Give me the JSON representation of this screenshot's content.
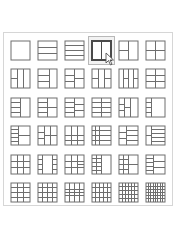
{
  "layout_picker": {
    "title": "Layout picker",
    "selected_index": 3,
    "colors": {
      "stroke": "#6e6e6e",
      "selected_stroke": "#4a4a4a",
      "selected_bg": "#f2f2f2",
      "selected_border": "#b8b8b8",
      "panel_border": "#d6d6d6"
    },
    "layouts": [
      {
        "name": "layout-1x1",
        "lines": []
      },
      {
        "name": "layout-3-rows",
        "lines": [
          [
            0,
            0.33,
            1,
            0.33
          ],
          [
            0,
            0.67,
            1,
            0.67
          ]
        ]
      },
      {
        "name": "layout-4-rows",
        "lines": [
          [
            0,
            0.25,
            1,
            0.25
          ],
          [
            0,
            0.5,
            1,
            0.5
          ],
          [
            0,
            0.75,
            1,
            0.75
          ]
        ]
      },
      {
        "name": "layout-2-cols",
        "lines": [
          [
            0.5,
            0,
            0.5,
            1
          ]
        ]
      },
      {
        "name": "layout-1-top-2-bottom",
        "lines": [
          [
            0.5,
            0,
            0.5,
            1
          ],
          [
            0,
            0.5,
            0.5,
            0.5
          ]
        ]
      },
      {
        "name": "layout-2x2",
        "lines": [
          [
            0.5,
            0,
            0.5,
            1
          ],
          [
            0,
            0.5,
            1,
            0.5
          ]
        ]
      },
      {
        "name": "layout-3-cols-split-left",
        "lines": [
          [
            0.33,
            0,
            0.33,
            1
          ],
          [
            0.67,
            0,
            0.67,
            1
          ],
          [
            0,
            0.5,
            0.33,
            0.5
          ]
        ]
      },
      {
        "name": "layout-left-3-rows-right-1",
        "lines": [
          [
            0.6,
            0,
            0.6,
            1
          ],
          [
            0,
            0.33,
            0.6,
            0.33
          ],
          [
            0,
            0.67,
            0.6,
            0.67
          ]
        ]
      },
      {
        "name": "layout-left-3-rows-right-2",
        "lines": [
          [
            0.5,
            0,
            0.5,
            1
          ],
          [
            0,
            0.33,
            0.5,
            0.33
          ],
          [
            0,
            0.67,
            0.5,
            0.67
          ],
          [
            0.5,
            0.5,
            1,
            0.5
          ]
        ]
      },
      {
        "name": "layout-3-cols-split-left-right",
        "lines": [
          [
            0.33,
            0,
            0.33,
            1
          ],
          [
            0.67,
            0,
            0.67,
            1
          ],
          [
            0,
            0.5,
            0.33,
            0.5
          ],
          [
            0.67,
            0.5,
            1,
            0.5
          ]
        ]
      },
      {
        "name": "layout-4-cols-split",
        "lines": [
          [
            0.25,
            0,
            0.25,
            1
          ],
          [
            0.5,
            0,
            0.5,
            1
          ],
          [
            0.75,
            0,
            0.75,
            1
          ],
          [
            0.25,
            0.5,
            0.5,
            0.5
          ],
          [
            0.75,
            0.5,
            1,
            0.5
          ]
        ]
      },
      {
        "name": "layout-2x3",
        "lines": [
          [
            0.5,
            0,
            0.5,
            1
          ],
          [
            0,
            0.33,
            1,
            0.33
          ],
          [
            0,
            0.67,
            1,
            0.67
          ]
        ]
      },
      {
        "name": "layout-left-4-rows-right-1",
        "lines": [
          [
            0.5,
            0,
            0.5,
            1
          ],
          [
            0,
            0.25,
            0.5,
            0.25
          ],
          [
            0,
            0.5,
            0.5,
            0.5
          ],
          [
            0,
            0.75,
            0.5,
            0.75
          ]
        ]
      },
      {
        "name": "layout-left-4-rows-right-2",
        "lines": [
          [
            0.5,
            0,
            0.5,
            1
          ],
          [
            0,
            0.25,
            0.5,
            0.25
          ],
          [
            0,
            0.5,
            0.5,
            0.5
          ],
          [
            0,
            0.75,
            0.5,
            0.75
          ],
          [
            0.5,
            0.5,
            1,
            0.5
          ]
        ]
      },
      {
        "name": "layout-left-4-rows-right-3",
        "lines": [
          [
            0.5,
            0,
            0.5,
            1
          ],
          [
            0,
            0.25,
            0.5,
            0.25
          ],
          [
            0,
            0.5,
            0.5,
            0.5
          ],
          [
            0,
            0.75,
            0.5,
            0.75
          ],
          [
            0.5,
            0.33,
            1,
            0.33
          ],
          [
            0.5,
            0.67,
            1,
            0.67
          ]
        ]
      },
      {
        "name": "layout-2x4",
        "lines": [
          [
            0.5,
            0,
            0.5,
            1
          ],
          [
            0,
            0.25,
            1,
            0.25
          ],
          [
            0,
            0.5,
            1,
            0.5
          ],
          [
            0,
            0.75,
            1,
            0.75
          ]
        ]
      },
      {
        "name": "layout-left-col-split-wide-right",
        "lines": [
          [
            0.3,
            0,
            0.3,
            1
          ],
          [
            0.6,
            0,
            0.6,
            1
          ],
          [
            0,
            0.33,
            0.3,
            0.33
          ],
          [
            0.3,
            0.5,
            0.6,
            0.5
          ],
          [
            0,
            0.67,
            0.3,
            0.67
          ]
        ]
      },
      {
        "name": "layout-narrow-left-4-rows",
        "lines": [
          [
            0.3,
            0,
            0.3,
            1
          ],
          [
            0,
            0.25,
            0.3,
            0.25
          ],
          [
            0,
            0.5,
            0.3,
            0.5
          ],
          [
            0,
            0.75,
            0.3,
            0.75
          ]
        ]
      },
      {
        "name": "layout-left-5-rows-right-2",
        "lines": [
          [
            0.4,
            0,
            0.4,
            1
          ],
          [
            0,
            0.2,
            0.4,
            0.2
          ],
          [
            0,
            0.4,
            0.4,
            0.4
          ],
          [
            0,
            0.6,
            0.4,
            0.6
          ],
          [
            0,
            0.8,
            0.4,
            0.8
          ],
          [
            0.4,
            0.5,
            1,
            0.5
          ]
        ]
      },
      {
        "name": "layout-3-cols-mixed",
        "lines": [
          [
            0.33,
            0,
            0.33,
            1
          ],
          [
            0.67,
            0,
            0.67,
            1
          ],
          [
            0,
            0.33,
            0.33,
            0.33
          ],
          [
            0,
            0.67,
            0.33,
            0.67
          ],
          [
            0.33,
            0.5,
            1,
            0.5
          ]
        ]
      },
      {
        "name": "layout-3x3-offset",
        "lines": [
          [
            0.33,
            0,
            0.33,
            1
          ],
          [
            0.67,
            0,
            0.67,
            1
          ],
          [
            0,
            0.5,
            1,
            0.5
          ],
          [
            0,
            0.75,
            1,
            0.75
          ]
        ]
      },
      {
        "name": "layout-left-4-right-4",
        "lines": [
          [
            0.4,
            0,
            0.4,
            1
          ],
          [
            0,
            0.25,
            1,
            0.25
          ],
          [
            0,
            0.5,
            1,
            0.5
          ],
          [
            0,
            0.75,
            1,
            0.75
          ],
          [
            0.2,
            0,
            0.2,
            1
          ]
        ]
      },
      {
        "name": "layout-left-3-right-4",
        "lines": [
          [
            0.4,
            0,
            0.4,
            1
          ],
          [
            0,
            0.33,
            0.4,
            0.33
          ],
          [
            0,
            0.67,
            0.4,
            0.67
          ],
          [
            0.4,
            0.25,
            1,
            0.25
          ],
          [
            0.4,
            0.5,
            1,
            0.5
          ],
          [
            0.4,
            0.75,
            1,
            0.75
          ]
        ]
      },
      {
        "name": "layout-narrow-left-5-rows",
        "lines": [
          [
            0.3,
            0,
            0.3,
            1
          ],
          [
            0.3,
            0.2,
            1,
            0.2
          ],
          [
            0.3,
            0.4,
            1,
            0.4
          ],
          [
            0.3,
            0.6,
            1,
            0.6
          ],
          [
            0.3,
            0.8,
            1,
            0.8
          ],
          [
            0,
            0.5,
            0.3,
            0.5
          ]
        ]
      },
      {
        "name": "layout-3x3",
        "lines": [
          [
            0.33,
            0,
            0.33,
            1
          ],
          [
            0.67,
            0,
            0.67,
            1
          ],
          [
            0,
            0.33,
            1,
            0.33
          ],
          [
            0,
            0.67,
            1,
            0.67
          ]
        ]
      },
      {
        "name": "layout-3-cols-side-rows",
        "lines": [
          [
            0.25,
            0,
            0.25,
            1
          ],
          [
            0.75,
            0,
            0.75,
            1
          ],
          [
            0,
            0.25,
            0.25,
            0.25
          ],
          [
            0,
            0.5,
            0.25,
            0.5
          ],
          [
            0,
            0.75,
            0.25,
            0.75
          ],
          [
            0.75,
            0.25,
            1,
            0.25
          ],
          [
            0.75,
            0.5,
            1,
            0.5
          ],
          [
            0.75,
            0.75,
            1,
            0.75
          ]
        ]
      },
      {
        "name": "layout-3x3-right-split",
        "lines": [
          [
            0.33,
            0,
            0.33,
            1
          ],
          [
            0.67,
            0,
            0.67,
            1
          ],
          [
            0,
            0.33,
            1,
            0.33
          ],
          [
            0,
            0.67,
            1,
            0.67
          ],
          [
            0.67,
            0.5,
            1,
            0.5
          ]
        ]
      },
      {
        "name": "layout-left-5-right-1",
        "lines": [
          [
            0.25,
            0,
            0.25,
            1
          ],
          [
            0.5,
            0,
            0.5,
            1
          ],
          [
            0,
            0.2,
            0.5,
            0.2
          ],
          [
            0,
            0.4,
            0.5,
            0.4
          ],
          [
            0,
            0.6,
            0.5,
            0.6
          ],
          [
            0,
            0.8,
            0.5,
            0.8
          ]
        ]
      },
      {
        "name": "layout-left-4-right-2",
        "lines": [
          [
            0.5,
            0,
            0.5,
            1
          ],
          [
            0,
            0.25,
            0.5,
            0.25
          ],
          [
            0,
            0.5,
            1,
            0.5
          ],
          [
            0,
            0.75,
            0.5,
            0.75
          ],
          [
            0.25,
            0,
            0.25,
            1
          ]
        ]
      },
      {
        "name": "layout-left-5-right-3",
        "lines": [
          [
            0.4,
            0,
            0.4,
            1
          ],
          [
            0,
            0.2,
            0.4,
            0.2
          ],
          [
            0,
            0.4,
            0.4,
            0.4
          ],
          [
            0,
            0.6,
            0.4,
            0.6
          ],
          [
            0,
            0.8,
            0.4,
            0.8
          ],
          [
            0.4,
            0.33,
            1,
            0.33
          ],
          [
            0.4,
            0.67,
            1,
            0.67
          ]
        ]
      },
      {
        "name": "layout-3x4",
        "lines": [
          [
            0.33,
            0,
            0.33,
            1
          ],
          [
            0.67,
            0,
            0.67,
            1
          ],
          [
            0,
            0.25,
            1,
            0.25
          ],
          [
            0,
            0.5,
            1,
            0.5
          ],
          [
            0,
            0.75,
            1,
            0.75
          ]
        ]
      },
      {
        "name": "layout-4x4",
        "lines": [
          [
            0.25,
            0,
            0.25,
            1
          ],
          [
            0.5,
            0,
            0.5,
            1
          ],
          [
            0.75,
            0,
            0.75,
            1
          ],
          [
            0,
            0.25,
            1,
            0.25
          ],
          [
            0,
            0.5,
            1,
            0.5
          ],
          [
            0,
            0.75,
            1,
            0.75
          ]
        ]
      },
      {
        "name": "layout-4x4-center",
        "lines": [
          [
            0.25,
            0,
            0.25,
            1
          ],
          [
            0.5,
            0,
            0.5,
            1
          ],
          [
            0.75,
            0,
            0.75,
            1
          ],
          [
            0,
            0.33,
            1,
            0.33
          ],
          [
            0,
            0.67,
            1,
            0.67
          ],
          [
            0,
            0.5,
            1,
            0.5
          ]
        ]
      },
      {
        "name": "layout-5x4",
        "lines": [
          [
            0.2,
            0,
            0.2,
            1
          ],
          [
            0.4,
            0,
            0.4,
            1
          ],
          [
            0.6,
            0,
            0.6,
            1
          ],
          [
            0.8,
            0,
            0.8,
            1
          ],
          [
            0,
            0.25,
            1,
            0.25
          ],
          [
            0,
            0.5,
            1,
            0.5
          ],
          [
            0,
            0.75,
            1,
            0.75
          ]
        ]
      },
      {
        "name": "layout-6x5",
        "lines": [
          [
            0.17,
            0,
            0.17,
            1
          ],
          [
            0.33,
            0,
            0.33,
            1
          ],
          [
            0.5,
            0,
            0.5,
            1
          ],
          [
            0.67,
            0,
            0.67,
            1
          ],
          [
            0.83,
            0,
            0.83,
            1
          ],
          [
            0,
            0.2,
            1,
            0.2
          ],
          [
            0,
            0.4,
            1,
            0.4
          ],
          [
            0,
            0.6,
            1,
            0.6
          ],
          [
            0,
            0.8,
            1,
            0.8
          ]
        ]
      },
      {
        "name": "layout-8x6",
        "lines": [
          [
            0.125,
            0,
            0.125,
            1
          ],
          [
            0.25,
            0,
            0.25,
            1
          ],
          [
            0.375,
            0,
            0.375,
            1
          ],
          [
            0.5,
            0,
            0.5,
            1
          ],
          [
            0.625,
            0,
            0.625,
            1
          ],
          [
            0.75,
            0,
            0.75,
            1
          ],
          [
            0.875,
            0,
            0.875,
            1
          ],
          [
            0,
            0.17,
            1,
            0.17
          ],
          [
            0,
            0.33,
            1,
            0.33
          ],
          [
            0,
            0.5,
            1,
            0.5
          ],
          [
            0,
            0.67,
            1,
            0.67
          ],
          [
            0,
            0.83,
            1,
            0.83
          ]
        ]
      }
    ]
  }
}
